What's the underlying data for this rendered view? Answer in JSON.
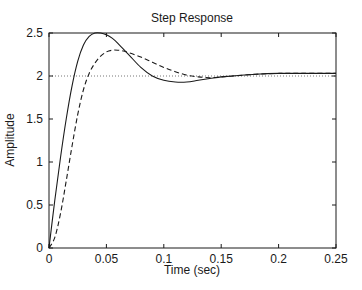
{
  "chart_data": {
    "type": "line",
    "title": "Step Response",
    "xlabel": "Time (sec)",
    "ylabel": "Amplitude",
    "xlim": [
      0,
      0.25
    ],
    "ylim": [
      0,
      2.5
    ],
    "xticks": [
      0,
      0.05,
      0.1,
      0.15,
      0.2,
      0.25
    ],
    "xtick_labels": [
      "0",
      "0.05",
      "0.1",
      "0.15",
      "0.2",
      "0.25"
    ],
    "yticks": [
      0,
      0.5,
      1,
      1.5,
      2,
      2.5
    ],
    "ytick_labels": [
      "0",
      "0.5",
      "1",
      "1.5",
      "2",
      "2.5"
    ],
    "grid": false,
    "legend": null,
    "reference_line": {
      "y": 2.0,
      "style": "dotted",
      "label": "steady-state"
    },
    "series": [
      {
        "name": "solid",
        "style": "solid",
        "color": "#1a1a1a",
        "x": [
          0,
          0.005,
          0.01,
          0.015,
          0.02,
          0.025,
          0.03,
          0.035,
          0.04,
          0.045,
          0.05,
          0.055,
          0.06,
          0.07,
          0.08,
          0.09,
          0.1,
          0.11,
          0.12,
          0.13,
          0.14,
          0.15,
          0.16,
          0.18,
          0.2,
          0.22,
          0.25
        ],
        "values": [
          0,
          0.55,
          1.05,
          1.5,
          1.88,
          2.17,
          2.36,
          2.46,
          2.5,
          2.5,
          2.48,
          2.44,
          2.38,
          2.24,
          2.1,
          2.0,
          1.95,
          1.93,
          1.93,
          1.95,
          1.97,
          1.99,
          2.0,
          2.02,
          2.03,
          2.03,
          2.03
        ]
      },
      {
        "name": "dashed",
        "style": "dashed",
        "color": "#1a1a1a",
        "x": [
          0,
          0.005,
          0.01,
          0.015,
          0.02,
          0.025,
          0.03,
          0.035,
          0.04,
          0.045,
          0.05,
          0.055,
          0.06,
          0.065,
          0.07,
          0.08,
          0.09,
          0.1,
          0.11,
          0.12,
          0.13,
          0.14,
          0.15,
          0.16,
          0.18,
          0.2,
          0.22,
          0.25
        ],
        "values": [
          0,
          0.12,
          0.4,
          0.78,
          1.18,
          1.55,
          1.84,
          2.03,
          2.15,
          2.23,
          2.28,
          2.3,
          2.3,
          2.29,
          2.27,
          2.22,
          2.16,
          2.1,
          2.05,
          2.01,
          1.99,
          1.98,
          1.99,
          2.0,
          2.02,
          2.03,
          2.03,
          2.03
        ]
      }
    ]
  },
  "layout": {
    "plot_left": 49,
    "plot_right": 336,
    "plot_top": 33,
    "plot_bottom": 248
  }
}
